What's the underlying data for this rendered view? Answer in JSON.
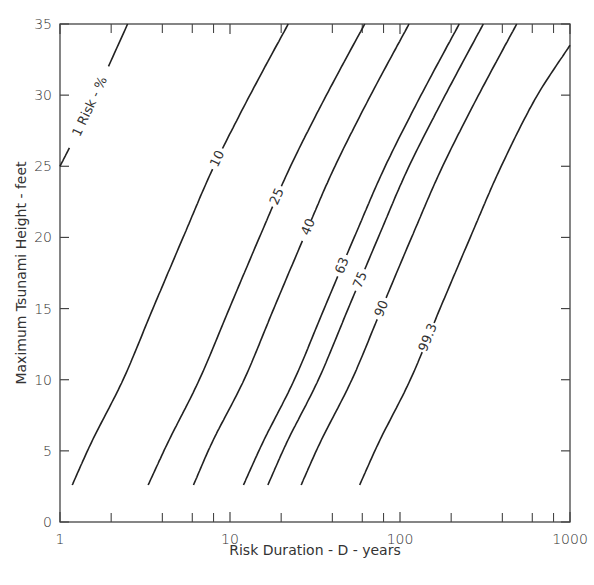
{
  "chart_data": {
    "type": "line",
    "title": "",
    "xlabel": "Risk Duration - D - years",
    "ylabel": "Maximum Tsunami Height - feet",
    "xscale": "log",
    "xlim": [
      1,
      1000
    ],
    "ylim": [
      0,
      35
    ],
    "grid": false,
    "legend": "inline curve labels",
    "x_ticks": [
      1,
      10,
      100,
      1000
    ],
    "x_tick_labels": [
      "1",
      "10",
      "100",
      "1000"
    ],
    "x_minor_ticks": [
      2,
      4,
      6,
      8,
      20,
      40,
      60,
      80,
      200,
      400,
      600,
      800
    ],
    "y_ticks": [
      0,
      5,
      10,
      15,
      20,
      25,
      30,
      35
    ],
    "y_tick_labels": [
      "0",
      "5",
      "10",
      "15",
      "20",
      "25",
      "30",
      "35"
    ],
    "series_label_prefix": "Risk - %",
    "series": [
      {
        "name": "1",
        "label": "1  Risk - %",
        "x": [
          1.0,
          1.5,
          2.5
        ],
        "y": [
          25,
          29.2,
          35
        ]
      },
      {
        "name": "10",
        "label": "10",
        "x": [
          1.18,
          1.56,
          2.35,
          3.52,
          5.3,
          7.9,
          12.7,
          22
        ],
        "y": [
          2.6,
          5.8,
          10,
          15,
          20,
          24.8,
          29.7,
          35
        ]
      },
      {
        "name": "25",
        "label": "25",
        "x": [
          3.3,
          4.4,
          6.6,
          9.9,
          14.9,
          22.3,
          35.8,
          62
        ],
        "y": [
          2.6,
          5.8,
          10,
          15,
          20,
          24.8,
          29.7,
          35
        ]
      },
      {
        "name": "40",
        "label": "40",
        "x": [
          6.1,
          8.0,
          12.1,
          18.1,
          27.2,
          40.7,
          65.3,
          113
        ],
        "y": [
          2.6,
          5.8,
          10,
          15,
          20,
          24.8,
          29.7,
          35
        ]
      },
      {
        "name": "63",
        "label": "63",
        "x": [
          12.0,
          15.9,
          23.9,
          35.8,
          53.8,
          80.4,
          129,
          223
        ],
        "y": [
          2.6,
          5.8,
          10,
          15,
          20,
          24.8,
          29.7,
          35
        ]
      },
      {
        "name": "75",
        "label": "75",
        "x": [
          16.7,
          22.0,
          33.1,
          49.6,
          74.5,
          111,
          179,
          309
        ],
        "y": [
          2.6,
          5.8,
          10,
          15,
          20,
          24.8,
          29.7,
          35
        ]
      },
      {
        "name": "90",
        "label": "90",
        "x": [
          26.2,
          34.6,
          52.1,
          78.0,
          117,
          175,
          281,
          486
        ],
        "y": [
          2.6,
          5.8,
          10,
          15,
          20,
          24.8,
          29.7,
          35
        ]
      },
      {
        "name": "99.3",
        "label": "99.3",
        "x": [
          57.9,
          76.5,
          115,
          172,
          259,
          387,
          622,
          1000
        ],
        "y": [
          2.6,
          5.8,
          10,
          15,
          20,
          24.8,
          29.7,
          33.5
        ]
      }
    ]
  }
}
